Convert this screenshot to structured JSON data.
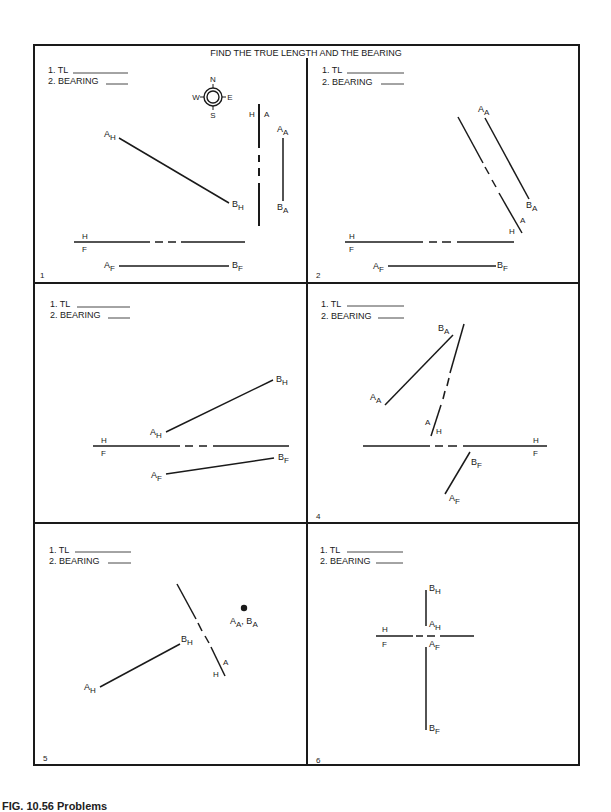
{
  "title": "FIND THE TRUE LENGTH AND THE BEARING",
  "answer_labels": {
    "tl": "1. TL",
    "bearing": "2. BEARING"
  },
  "compass": {
    "n": "N",
    "s": "S",
    "e": "E",
    "w": "W"
  },
  "caption": "FIG. 10.56 Problems",
  "panels": [
    {
      "number": "1",
      "fold_labels": [
        "H",
        "F",
        "H",
        "A"
      ],
      "points": [
        "A_H",
        "B_H",
        "A_F",
        "B_F",
        "A_A",
        "B_A"
      ]
    },
    {
      "number": "2",
      "fold_labels": [
        "H",
        "F",
        "A",
        "H"
      ],
      "points": [
        "A_A",
        "B_A",
        "A_F",
        "B_F"
      ]
    },
    {
      "number": "",
      "fold_labels": [
        "H",
        "F"
      ],
      "points": [
        "A_H",
        "B_H",
        "A_F",
        "B_F"
      ]
    },
    {
      "number": "4",
      "fold_labels": [
        "H",
        "F",
        "A",
        "H"
      ],
      "points": [
        "A_A",
        "B_A",
        "A_F",
        "B_F"
      ]
    },
    {
      "number": "5",
      "fold_labels": [
        "A",
        "H"
      ],
      "points": [
        "A_H",
        "B_H",
        "A_A, B_A"
      ]
    },
    {
      "number": "6",
      "fold_labels": [
        "H",
        "F"
      ],
      "points": [
        "B_H",
        "A_H",
        "A_F",
        "B_F"
      ]
    }
  ]
}
